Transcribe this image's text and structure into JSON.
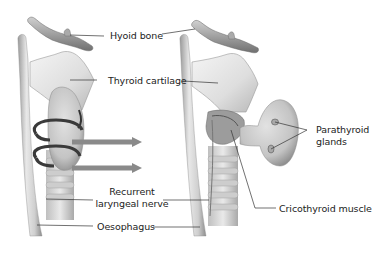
{
  "figure": {
    "left_view": "Anterior view with thyroid gland in place, rotation arrows",
    "right_view": "Thyroid lobe rotated medially, exposing parathyroid glands and nerve"
  },
  "labels": {
    "hyoid_bone": "Hyoid bone",
    "thyroid_cartilage": "Thyroid cartilage",
    "parathyroid_line1": "Parathyroid",
    "parathyroid_line2": "glands",
    "recurrent_line1": "Recurrent",
    "recurrent_line2": "laryngeal nerve",
    "cricothyroid_muscle": "Cricothyroid muscle",
    "oesophagus": "Oesophagus"
  },
  "colors": {
    "background": "#ffffff",
    "arrow": "#8a8a8a",
    "rotation_arrow": "#3a3a3a",
    "leader_line": "#333333",
    "tissue_light": "#e6e6e6",
    "tissue_mid": "#bdbdbd",
    "tissue_dark": "#7a7a7a",
    "gland": "#c9c9c9"
  }
}
